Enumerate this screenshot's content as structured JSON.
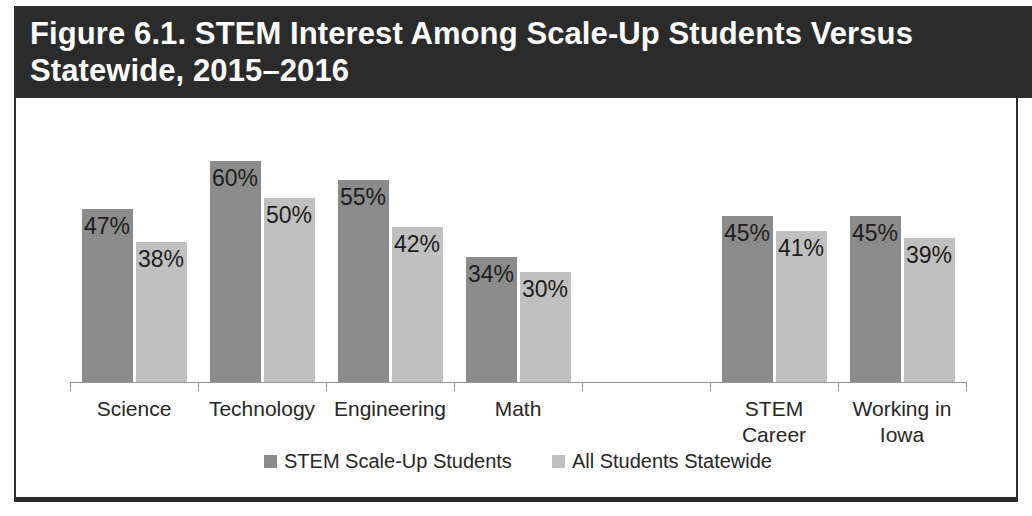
{
  "figure": {
    "title": "Figure 6.1. STEM Interest Among Scale-Up Students Versus\nStatewide, 2015–2016",
    "title_band_color": "#2b2b2b",
    "border_color": "#2b2b2b"
  },
  "chart_data": {
    "type": "bar",
    "title": "Figure 6.1. STEM Interest Among Scale-Up Students Versus Statewide, 2015–2016",
    "xlabel": "",
    "ylabel": "",
    "ylim": [
      0,
      75
    ],
    "grid": false,
    "legend_position": "bottom",
    "categories": [
      "Science",
      "Technology",
      "Engineering",
      "Math",
      "",
      "STEM Career",
      "Working in Iowa"
    ],
    "series": [
      {
        "name": "STEM Scale-Up Students",
        "color": "#8b8b8b",
        "values": [
          47,
          60,
          55,
          34,
          null,
          45,
          45
        ],
        "labels": [
          "47%",
          "60%",
          "55%",
          "34%",
          "",
          "45%",
          "45%"
        ]
      },
      {
        "name": "All Students Statewide",
        "color": "#c0c0c0",
        "values": [
          38,
          50,
          42,
          30,
          null,
          41,
          39
        ],
        "labels": [
          "38%",
          "50%",
          "42%",
          "30%",
          "",
          "41%",
          "39%"
        ]
      }
    ]
  },
  "legend": {
    "items": [
      {
        "label": "STEM Scale-Up Students",
        "color": "#8b8b8b",
        "swatch_name": "legend-swatch-scale-up"
      },
      {
        "label": "All Students Statewide",
        "color": "#c0c0c0",
        "swatch_name": "legend-swatch-statewide"
      }
    ]
  }
}
